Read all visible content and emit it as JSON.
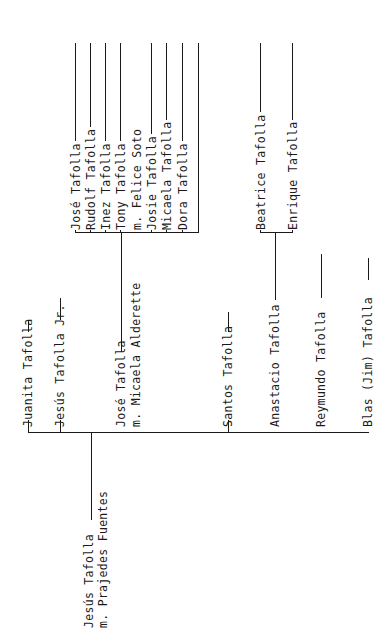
{
  "root": {
    "name": "Jesús Tafolla",
    "spouse": "m. Prajedes Fuentes"
  },
  "children": [
    {
      "name": "Juanita Tafolla"
    },
    {
      "name": "Jesús Tafolla Jr."
    },
    {
      "name": "José Tafolla",
      "spouse": "m. Micaela Alderette",
      "children": [
        "José Tafolla",
        "Rudolf Tafolla",
        "Inez Tafolla",
        "Tony Tafolla",
        "m. Felice Soto",
        "Josie Tafolla",
        "Micaela Tafolla",
        "Dora Tafolla"
      ]
    },
    {
      "name": "Santos Tafolla"
    },
    {
      "name": "Anastacio Tafolla",
      "children": [
        "Beatrice Tafolla",
        "Enrique Tafolla"
      ]
    },
    {
      "name": "Reymundo Tafolla"
    },
    {
      "name": "Blas (Jim) Tafolla"
    }
  ]
}
